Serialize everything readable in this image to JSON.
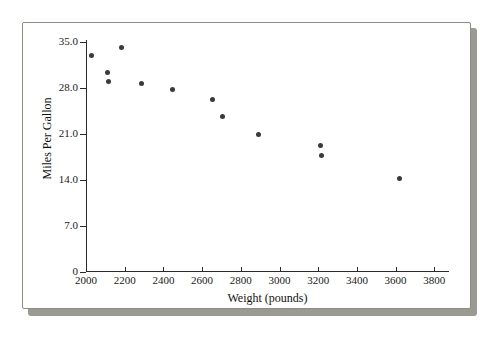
{
  "chart_data": {
    "type": "scatter",
    "title": "",
    "xlabel": "Weight (pounds)",
    "ylabel": "Miles Per Gallon",
    "xlim": [
      2000,
      3880
    ],
    "ylim": [
      0,
      36.5
    ],
    "grid": false,
    "legend": null,
    "xticks": [
      "2000",
      "2200",
      "2400",
      "2600",
      "2800",
      "3000",
      "3200",
      "3400",
      "3600",
      "3800"
    ],
    "xtick_values": [
      2000,
      2200,
      2400,
      2600,
      2800,
      3000,
      3200,
      3400,
      3600,
      3800
    ],
    "yticks": [
      "0",
      "7.0",
      "14.0",
      "21.0",
      "28.0",
      "35.0"
    ],
    "ytick_values": [
      0,
      7,
      14,
      21,
      28,
      35
    ],
    "x": [
      2027,
      2184,
      2112,
      2118,
      2288,
      2446,
      2656,
      2703,
      2890,
      3210,
      3219,
      3620
    ],
    "y": [
      33.0,
      34.1,
      30.4,
      29.0,
      28.7,
      27.8,
      23.7,
      26.3,
      20.9,
      19.3,
      17.8,
      14.2
    ],
    "points": [
      {
        "x": 2027,
        "y": 33.0
      },
      {
        "x": 2112,
        "y": 30.4
      },
      {
        "x": 2118,
        "y": 29.0
      },
      {
        "x": 2184,
        "y": 34.1
      },
      {
        "x": 2288,
        "y": 28.7
      },
      {
        "x": 2446,
        "y": 27.8
      },
      {
        "x": 2656,
        "y": 26.3
      },
      {
        "x": 2703,
        "y": 23.7
      },
      {
        "x": 2890,
        "y": 20.9
      },
      {
        "x": 3210,
        "y": 19.3
      },
      {
        "x": 3219,
        "y": 17.8
      },
      {
        "x": 3620,
        "y": 14.2
      }
    ],
    "marker": {
      "shape": "circle",
      "color": "#3a3a3a",
      "size": 5
    }
  },
  "figure": {
    "background_color": "#ffffff",
    "border_color": "#8d8d86",
    "shadow_color": "#9a9a93"
  }
}
